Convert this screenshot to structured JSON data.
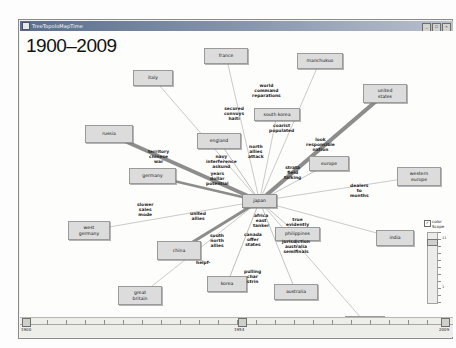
{
  "window": {
    "title": "TreeTopoloMapTime",
    "buttons": {
      "minimize": "_",
      "maximize": "□",
      "close": "×"
    }
  },
  "canvas": {
    "year_range_label": "1900–2009"
  },
  "nodes": [
    {
      "id": "france",
      "label": "france",
      "x": 184,
      "y": 17,
      "w": 44,
      "h": 16
    },
    {
      "id": "manchukuo",
      "label": "manchukuo",
      "x": 277,
      "y": 22,
      "w": 46,
      "h": 16
    },
    {
      "id": "italy",
      "label": "italy",
      "x": 113,
      "y": 39,
      "w": 40,
      "h": 16
    },
    {
      "id": "united-states",
      "label": "united\nstates",
      "x": 343,
      "y": 53,
      "w": 44,
      "h": 19
    },
    {
      "id": "south-korea",
      "label": "south korea",
      "x": 234,
      "y": 77,
      "w": 46,
      "h": 13
    },
    {
      "id": "russia",
      "label": "russia",
      "x": 65,
      "y": 94,
      "w": 48,
      "h": 18
    },
    {
      "id": "england",
      "label": "england",
      "x": 177,
      "y": 102,
      "w": 44,
      "h": 16
    },
    {
      "id": "europe",
      "label": "europe",
      "x": 289,
      "y": 125,
      "w": 40,
      "h": 15
    },
    {
      "id": "western-europe",
      "label": "western\neurope",
      "x": 377,
      "y": 136,
      "w": 44,
      "h": 19
    },
    {
      "id": "germany",
      "label": "germany",
      "x": 109,
      "y": 137,
      "w": 47,
      "h": 16
    },
    {
      "id": "japan",
      "label": "japan",
      "x": 222,
      "y": 163,
      "w": 35,
      "h": 14,
      "hub": true
    },
    {
      "id": "philippines",
      "label": "philippines",
      "x": 255,
      "y": 196,
      "w": 45,
      "h": 14
    },
    {
      "id": "india",
      "label": "india",
      "x": 356,
      "y": 199,
      "w": 38,
      "h": 16
    },
    {
      "id": "west-germany",
      "label": "west\ngermany",
      "x": 48,
      "y": 190,
      "w": 42,
      "h": 19
    },
    {
      "id": "china",
      "label": "china",
      "x": 137,
      "y": 210,
      "w": 44,
      "h": 19
    },
    {
      "id": "korea",
      "label": "korea",
      "x": 187,
      "y": 245,
      "w": 40,
      "h": 16
    },
    {
      "id": "australia",
      "label": "australia",
      "x": 254,
      "y": 253,
      "w": 44,
      "h": 16
    },
    {
      "id": "great-britain",
      "label": "great\nbritain",
      "x": 98,
      "y": 255,
      "w": 44,
      "h": 19
    },
    {
      "id": "canada",
      "label": "canada",
      "x": 325,
      "y": 285,
      "w": 40,
      "h": 13
    }
  ],
  "edge_labels": [
    {
      "id": "world-command-reparations",
      "text": "world\ncommand\nreparations",
      "x": 232,
      "y": 52
    },
    {
      "id": "secured-convoys-haiti",
      "text": "secured\nconvoys\nhaiti",
      "x": 204,
      "y": 75
    },
    {
      "id": "coarist-populated",
      "text": "coarist\npopulated",
      "x": 249,
      "y": 92
    },
    {
      "id": "territory-chinese",
      "text": "territory\nchinese\nwar",
      "x": 128,
      "y": 118
    },
    {
      "id": "navy-interference-askund",
      "text": "navy\ninterference\naskund",
      "x": 186,
      "y": 123
    },
    {
      "id": "north-allies-attack",
      "text": "north\nallies\nattack",
      "x": 228,
      "y": 113
    },
    {
      "id": "look-responsible-nation",
      "text": "look\nresponsible\nnation",
      "x": 286,
      "y": 106
    },
    {
      "id": "years-dollar-potential",
      "text": "years\ndollar\npotential",
      "x": 186,
      "y": 140
    },
    {
      "id": "strata-field-talking",
      "text": "strata\nfield\ntalking",
      "x": 264,
      "y": 134
    },
    {
      "id": "dealers-to-months",
      "text": "dealers\nto\nmonths",
      "x": 330,
      "y": 152
    },
    {
      "id": "slower-sales-mode",
      "text": "slower\nsales\nmode",
      "x": 117,
      "y": 171
    },
    {
      "id": "africa-east-tanker",
      "text": "africa\neast\ntanker",
      "x": 233,
      "y": 182
    },
    {
      "id": "true-evidently",
      "text": "true\nevidently",
      "x": 266,
      "y": 186
    },
    {
      "id": "united-allies",
      "text": "united\nallies",
      "x": 170,
      "y": 180
    },
    {
      "id": "south-north-allies",
      "text": "south\nnorth\nallies",
      "x": 190,
      "y": 202
    },
    {
      "id": "canada-offer-states",
      "text": "canada\noffer\nstates",
      "x": 224,
      "y": 201
    },
    {
      "id": "jurisdiction-australia",
      "text": "jurisdiction\naustralia\nsemifinals",
      "x": 262,
      "y": 208
    },
    {
      "id": "helpf",
      "text": "helpf-",
      "x": 176,
      "y": 229
    },
    {
      "id": "pulling-char-string",
      "text": "pulling\nchar\nstrin",
      "x": 224,
      "y": 238
    }
  ],
  "edges": [
    {
      "from": "japan",
      "to": "russia",
      "weight": 3.6
    },
    {
      "from": "japan",
      "to": "united-states",
      "weight": 4.2
    },
    {
      "from": "japan",
      "to": "china",
      "weight": 3.2
    },
    {
      "from": "japan",
      "to": "germany",
      "weight": 2.4
    },
    {
      "from": "japan",
      "to": "england",
      "weight": 1.0
    },
    {
      "from": "japan",
      "to": "france",
      "weight": 0.8
    },
    {
      "from": "japan",
      "to": "italy",
      "weight": 0.8
    },
    {
      "from": "japan",
      "to": "manchukuo",
      "weight": 0.8
    },
    {
      "from": "japan",
      "to": "south-korea",
      "weight": 0.8
    },
    {
      "from": "japan",
      "to": "europe",
      "weight": 0.9
    },
    {
      "from": "japan",
      "to": "western-europe",
      "weight": 0.8
    },
    {
      "from": "japan",
      "to": "philippines",
      "weight": 0.9
    },
    {
      "from": "japan",
      "to": "india",
      "weight": 0.8
    },
    {
      "from": "japan",
      "to": "korea",
      "weight": 1.0
    },
    {
      "from": "japan",
      "to": "australia",
      "weight": 0.9
    },
    {
      "from": "japan",
      "to": "canada",
      "weight": 0.8
    },
    {
      "from": "japan",
      "to": "west-germany",
      "weight": 0.8
    },
    {
      "from": "japan",
      "to": "great-britain",
      "weight": 0.8
    }
  ],
  "scope_panel": {
    "checkbox_checked": true,
    "checkbox_glyph": "✓",
    "label": "color\nScope",
    "tick_labels": [
      "11",
      "1"
    ]
  },
  "timeline": {
    "start_label": "1900",
    "end_label": "2009",
    "current_label": "1954",
    "current_position_pct": 51
  }
}
